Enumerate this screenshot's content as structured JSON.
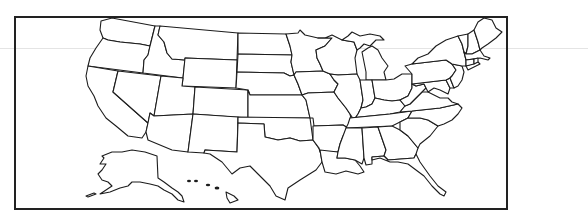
{
  "map": {
    "title": "",
    "type": "outline-map",
    "region": "United States",
    "labels_visible": false,
    "colors": {
      "stroke": "#1c1c1c",
      "fill": "#ffffff",
      "frame": "#222222",
      "background": "#ffffff"
    },
    "states": [
      {
        "id": "WA",
        "name": "Washington"
      },
      {
        "id": "OR",
        "name": "Oregon"
      },
      {
        "id": "CA",
        "name": "California"
      },
      {
        "id": "ID",
        "name": "Idaho"
      },
      {
        "id": "NV",
        "name": "Nevada"
      },
      {
        "id": "MT",
        "name": "Montana"
      },
      {
        "id": "WY",
        "name": "Wyoming"
      },
      {
        "id": "UT",
        "name": "Utah"
      },
      {
        "id": "AZ",
        "name": "Arizona"
      },
      {
        "id": "CO",
        "name": "Colorado"
      },
      {
        "id": "NM",
        "name": "New Mexico"
      },
      {
        "id": "ND",
        "name": "North Dakota"
      },
      {
        "id": "SD",
        "name": "South Dakota"
      },
      {
        "id": "NE",
        "name": "Nebraska"
      },
      {
        "id": "KS",
        "name": "Kansas"
      },
      {
        "id": "OK",
        "name": "Oklahoma"
      },
      {
        "id": "TX",
        "name": "Texas"
      },
      {
        "id": "MN",
        "name": "Minnesota"
      },
      {
        "id": "IA",
        "name": "Iowa"
      },
      {
        "id": "MO",
        "name": "Missouri"
      },
      {
        "id": "AR",
        "name": "Arkansas"
      },
      {
        "id": "LA",
        "name": "Louisiana"
      },
      {
        "id": "WI",
        "name": "Wisconsin"
      },
      {
        "id": "IL",
        "name": "Illinois"
      },
      {
        "id": "MI",
        "name": "Michigan"
      },
      {
        "id": "IN",
        "name": "Indiana"
      },
      {
        "id": "OH",
        "name": "Ohio"
      },
      {
        "id": "KY",
        "name": "Kentucky"
      },
      {
        "id": "TN",
        "name": "Tennessee"
      },
      {
        "id": "MS",
        "name": "Mississippi"
      },
      {
        "id": "AL",
        "name": "Alabama"
      },
      {
        "id": "GA",
        "name": "Georgia"
      },
      {
        "id": "FL",
        "name": "Florida"
      },
      {
        "id": "SC",
        "name": "South Carolina"
      },
      {
        "id": "NC",
        "name": "North Carolina"
      },
      {
        "id": "VA",
        "name": "Virginia"
      },
      {
        "id": "WV",
        "name": "West Virginia"
      },
      {
        "id": "MD",
        "name": "Maryland"
      },
      {
        "id": "DE",
        "name": "Delaware"
      },
      {
        "id": "PA",
        "name": "Pennsylvania"
      },
      {
        "id": "NJ",
        "name": "New Jersey"
      },
      {
        "id": "NY",
        "name": "New York"
      },
      {
        "id": "CT",
        "name": "Connecticut"
      },
      {
        "id": "RI",
        "name": "Rhode Island"
      },
      {
        "id": "MA",
        "name": "Massachusetts"
      },
      {
        "id": "VT",
        "name": "Vermont"
      },
      {
        "id": "NH",
        "name": "New Hampshire"
      },
      {
        "id": "ME",
        "name": "Maine"
      },
      {
        "id": "AK",
        "name": "Alaska"
      },
      {
        "id": "HI",
        "name": "Hawaii"
      }
    ]
  }
}
